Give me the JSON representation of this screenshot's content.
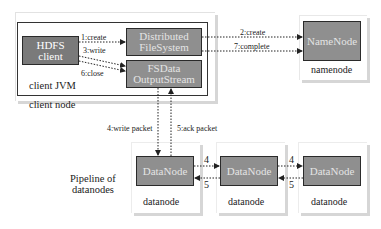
{
  "diagram": {
    "type": "HDFS write data flow",
    "client_node": {
      "label": "client node",
      "jvm": {
        "label": "client JVM",
        "hdfs_client": {
          "line1": "HDFS",
          "line2": "client"
        },
        "distributed_filesystem": {
          "line1": "Distributed",
          "line2": "FileSystem"
        },
        "fsdata_outputstream": {
          "line1": "FSData",
          "line2": "OutputStream"
        }
      }
    },
    "namenode": {
      "box_label": "NameNode",
      "host_label": "namenode"
    },
    "pipeline_label": {
      "line1": "Pipeline of",
      "line2": "datanodes"
    },
    "datanodes": [
      {
        "box_label": "DataNode",
        "host_label": "datanode"
      },
      {
        "box_label": "DataNode",
        "host_label": "datanode"
      },
      {
        "box_label": "DataNode",
        "host_label": "datanode"
      }
    ],
    "edges": {
      "create": "1:create",
      "nn_create": "2:create",
      "write": "3:write",
      "write_packet": "4:write packet",
      "ack_packet": "5:ack packet",
      "close": "6:close",
      "complete": "7:complete",
      "dn_forward_1": "4",
      "dn_ack_1": "5",
      "dn_forward_2": "4",
      "dn_ack_2": "5"
    },
    "colors": {
      "node_fill": "#8f8f8f",
      "hdfs_client_fill": "#7a7a7a",
      "node_border": "#2a2a2a",
      "shadow": "#d6d6d6",
      "arrow": "#222222"
    }
  }
}
